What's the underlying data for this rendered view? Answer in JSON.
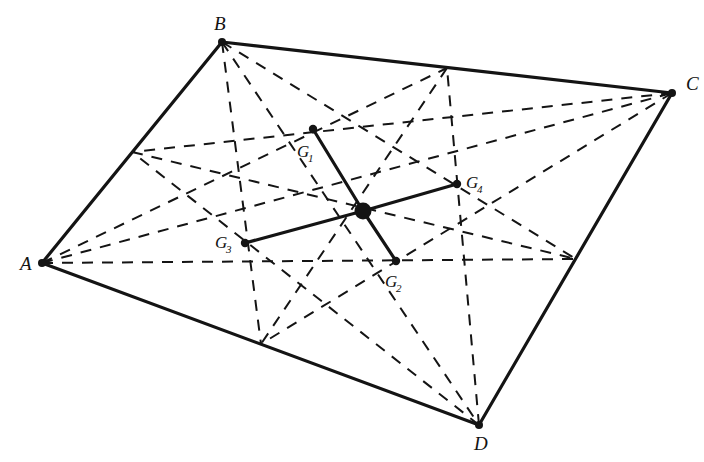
{
  "figure": {
    "background_color": "#ffffff",
    "stroke_color": "#141414",
    "width": 704,
    "height": 462
  },
  "style": {
    "solid_width": 3.2,
    "dashed_width": 2.0,
    "dash_pattern": "11,9",
    "vertex_dot_radius": 4.0,
    "centroid_dot_radius": 4.2,
    "hub_dot_radius": 8.5
  },
  "vertices": [
    {
      "id": "A",
      "label": "A",
      "x": 42,
      "y": 263,
      "label_x": 20,
      "label_y": 270,
      "dot": true
    },
    {
      "id": "B",
      "label": "B",
      "x": 222,
      "y": 42,
      "label_x": 214,
      "label_y": 30,
      "dot": true
    },
    {
      "id": "C",
      "label": "C",
      "x": 672,
      "y": 93,
      "label_x": 686,
      "label_y": 90,
      "dot": true
    },
    {
      "id": "D",
      "label": "D",
      "x": 479,
      "y": 425,
      "label_x": 474,
      "label_y": 450,
      "dot": true
    }
  ],
  "edges": [
    {
      "from": "A",
      "to": "B",
      "style": "solid"
    },
    {
      "from": "B",
      "to": "C",
      "style": "solid"
    },
    {
      "from": "C",
      "to": "D",
      "style": "solid"
    },
    {
      "from": "D",
      "to": "A",
      "style": "solid"
    }
  ],
  "midpoints": [
    {
      "id": "M_AB",
      "x": 132,
      "y": 152
    },
    {
      "id": "M_BC",
      "x": 447,
      "y": 68
    },
    {
      "id": "M_CD",
      "x": 576,
      "y": 259
    },
    {
      "id": "M_DA",
      "x": 261,
      "y": 344
    }
  ],
  "diagonals": [
    {
      "from": "A",
      "to": "C",
      "style": "dashed"
    },
    {
      "from": "B",
      "to": "D",
      "style": "dashed"
    }
  ],
  "medians": [
    {
      "from": "A",
      "to": "M_BC",
      "style": "dashed"
    },
    {
      "from": "B",
      "to": "M_CD",
      "style": "dashed"
    },
    {
      "from": "C",
      "to": "M_DA",
      "style": "dashed"
    },
    {
      "from": "D",
      "to": "M_AB",
      "style": "dashed"
    },
    {
      "from": "A",
      "to": "M_CD",
      "style": "dashed"
    },
    {
      "from": "B",
      "to": "M_DA",
      "style": "dashed"
    },
    {
      "from": "C",
      "to": "M_AB",
      "style": "dashed"
    },
    {
      "from": "D",
      "to": "M_BC",
      "style": "dashed"
    },
    {
      "from": "M_AB",
      "to": "M_CD",
      "style": "dashed"
    },
    {
      "from": "M_BC",
      "to": "M_DA",
      "style": "dashed"
    }
  ],
  "centroids": [
    {
      "id": "G1",
      "label": "G",
      "sub": "1",
      "x": 313,
      "y": 129,
      "label_x": 297,
      "label_y": 157,
      "sub_dx": 11,
      "sub_dy": 5
    },
    {
      "id": "G2",
      "label": "G",
      "sub": "2",
      "x": 396,
      "y": 261,
      "label_x": 385,
      "label_y": 287,
      "sub_dx": 11,
      "sub_dy": 5
    },
    {
      "id": "G3",
      "label": "G",
      "sub": "3",
      "x": 245,
      "y": 243,
      "label_x": 215,
      "label_y": 248,
      "sub_dx": 11,
      "sub_dy": 5
    },
    {
      "id": "G4",
      "label": "G",
      "sub": "4",
      "x": 457,
      "y": 184,
      "label_x": 466,
      "label_y": 188,
      "sub_dx": 11,
      "sub_dy": 5
    }
  ],
  "hub": {
    "id": "G",
    "x": 363,
    "y": 211
  },
  "hub_spokes": [
    {
      "from": "G",
      "to": "G1",
      "style": "solid"
    },
    {
      "from": "G",
      "to": "G2",
      "style": "solid"
    },
    {
      "from": "G",
      "to": "G3",
      "style": "solid"
    },
    {
      "from": "G",
      "to": "G4",
      "style": "solid"
    }
  ]
}
